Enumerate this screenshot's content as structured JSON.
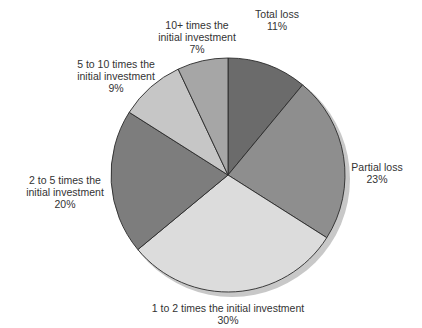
{
  "chart_data": {
    "type": "pie",
    "title": "",
    "start_angle_deg": 0,
    "direction": "clockwise",
    "center": [
      228,
      175
    ],
    "radius": 117,
    "shadow": true,
    "slices": [
      {
        "label": "Total loss",
        "value": 11,
        "display": "11%",
        "color": "#6b6b6b",
        "label_pos": [
          277,
          8
        ],
        "label_lines": [
          "Total loss",
          "11%"
        ]
      },
      {
        "label": "Partial loss",
        "value": 23,
        "display": "23%",
        "color": "#8e8e8e",
        "label_pos": [
          377,
          161
        ],
        "label_lines": [
          "Partial loss",
          "23%"
        ]
      },
      {
        "label": "1 to 2 times the initial investment",
        "value": 30,
        "display": "30%",
        "color": "#dcdcdc",
        "label_pos": [
          228,
          302
        ],
        "label_lines": [
          "1 to 2 times the initial investment",
          "30%"
        ]
      },
      {
        "label": "2 to 5 times the initial investment",
        "value": 20,
        "display": "20%",
        "color": "#7d7d7d",
        "label_pos": [
          65,
          174
        ],
        "label_lines": [
          "2 to 5 times the",
          "initial investment",
          "20%"
        ]
      },
      {
        "label": "5 to 10 times the initial investment",
        "value": 9,
        "display": "9%",
        "color": "#c6c6c6",
        "label_pos": [
          116,
          58
        ],
        "label_lines": [
          "5 to 10 times the",
          "initial investment",
          "9%"
        ]
      },
      {
        "label": "10+ times the initial investment",
        "value": 7,
        "display": "7%",
        "color": "#a6a6a6",
        "label_pos": [
          197,
          19
        ],
        "label_lines": [
          "10+ times the",
          "initial investment",
          "7%"
        ]
      }
    ]
  }
}
